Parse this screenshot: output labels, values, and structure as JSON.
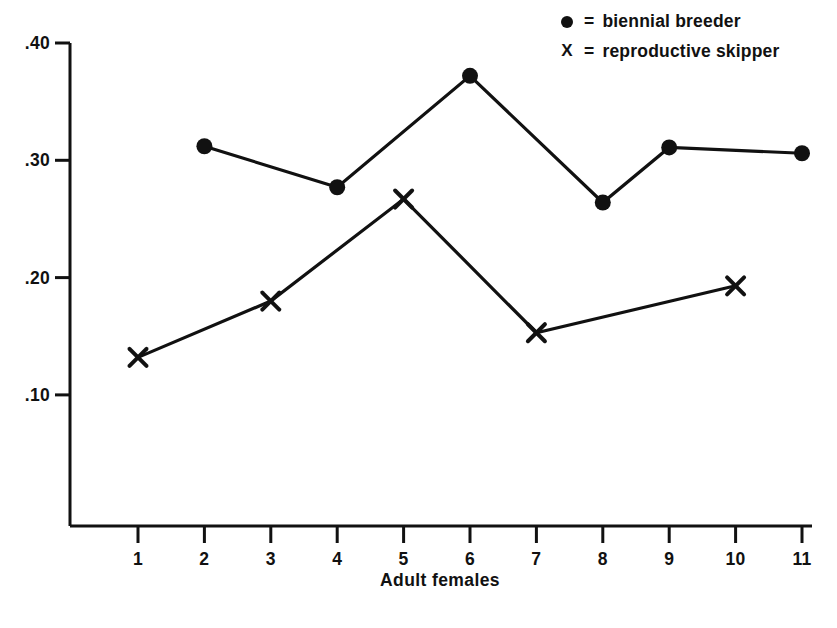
{
  "chart_data": {
    "type": "line",
    "title": "",
    "xlabel": "Adult  females",
    "ylabel": "",
    "x": [
      1,
      2,
      3,
      4,
      5,
      6,
      7,
      8,
      9,
      10,
      11
    ],
    "xtick_labels": [
      "1",
      "2",
      "3",
      "4",
      "5",
      "6",
      "7",
      "8",
      "9",
      "10",
      "11"
    ],
    "ytick_labels": [
      ".40",
      ".30",
      ".20",
      ".10"
    ],
    "ytick_values": [
      0.4,
      0.3,
      0.2,
      0.1
    ],
    "ylim": [
      0.0,
      0.425
    ],
    "xlim": [
      0.5,
      11.4
    ],
    "grid": false,
    "legend_position": "top-right",
    "series": [
      {
        "name": "biennial breeder",
        "marker": "filled-circle",
        "x": [
          2,
          4,
          6,
          8,
          9,
          11
        ],
        "values": [
          0.312,
          0.277,
          0.372,
          0.264,
          0.311,
          0.306
        ]
      },
      {
        "name": "reproductive skipper",
        "marker": "x",
        "x": [
          1,
          3,
          5,
          7,
          10
        ],
        "values": [
          0.132,
          0.18,
          0.267,
          0.153,
          0.193
        ]
      }
    ]
  },
  "legend": {
    "items": [
      {
        "marker": "filled-circle",
        "equals": "=",
        "label": "biennial breeder"
      },
      {
        "marker": "X",
        "equals": "=",
        "label": "reproductive skipper"
      }
    ]
  },
  "axes": {
    "x_title": "Adult  females",
    "y_labels": [
      ".40",
      ".30",
      ".20",
      ".10"
    ],
    "x_labels": [
      "1",
      "2",
      "3",
      "4",
      "5",
      "6",
      "7",
      "8",
      "9",
      "10",
      "11"
    ]
  },
  "colors": {
    "ink": "#111111",
    "background": "#ffffff"
  }
}
